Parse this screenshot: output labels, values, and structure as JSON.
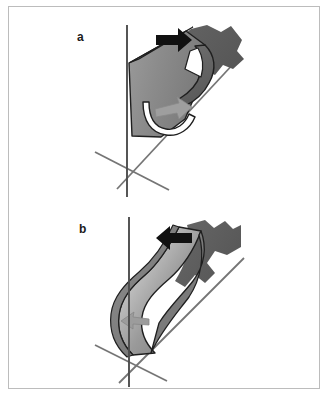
{
  "figure": {
    "kind": "scientific-line-diagram",
    "background_color": "#ffffff",
    "frame_color": "#bcbcbc",
    "panels": [
      {
        "id": "a",
        "label": "a",
        "arrow": {
          "name": "load-arrow",
          "direction": "right",
          "color": "#111111"
        },
        "inner_arrow": {
          "name": "flow-arrow",
          "direction": "down-right",
          "color": "#9a9a9a"
        },
        "surface_state": "flat-sheet",
        "colors": {
          "sheet_light": "#8e8e8e",
          "sheet_mid": "#7d7d7d",
          "sheet_dark": "#5d5d5d",
          "outline": "#1c1c1c",
          "axis": "#6e6e6e"
        },
        "axes": [
          {
            "name": "vertical-axis"
          },
          {
            "name": "diagonal-axis-right"
          },
          {
            "name": "diagonal-axis-left"
          }
        ]
      },
      {
        "id": "b",
        "label": "b",
        "arrow": {
          "name": "load-arrow",
          "direction": "left",
          "color": "#111111"
        },
        "inner_arrow": {
          "name": "flow-arrow",
          "direction": "left",
          "color": "#9a9a9a"
        },
        "surface_state": "buckled-sheet",
        "colors": {
          "sheet_light": "#b0b0b0",
          "sheet_mid": "#8a8a8a",
          "sheet_dark": "#5d5d5d",
          "outline": "#1c1c1c",
          "axis": "#6e6e6e"
        },
        "axes": [
          {
            "name": "vertical-axis"
          },
          {
            "name": "diagonal-axis-right"
          },
          {
            "name": "diagonal-axis-left"
          }
        ]
      }
    ]
  }
}
